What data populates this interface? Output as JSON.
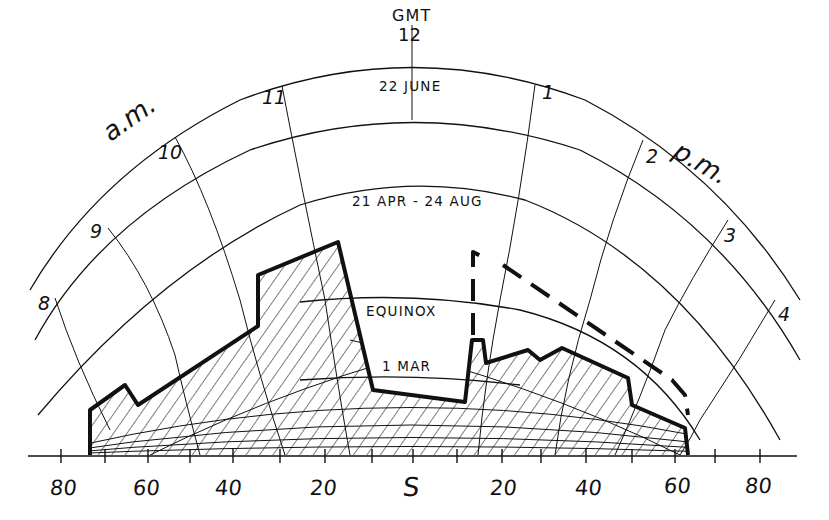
{
  "diagram": {
    "time_reference": {
      "label": "GMT",
      "value": "12"
    },
    "date_curves": [
      {
        "id": "summer-solstice",
        "label": "22 JUNE"
      },
      {
        "id": "apr-aug",
        "label": "21 APR - 24 AUG"
      },
      {
        "id": "equinox",
        "label": "EQUINOX"
      },
      {
        "id": "mar",
        "label": "1 MAR"
      }
    ],
    "hour_lines": {
      "am_label": "a.m.",
      "pm_label": "p.m.",
      "am": [
        "8",
        "9",
        "10",
        "11"
      ],
      "pm": [
        "1",
        "2",
        "3",
        "4"
      ]
    },
    "azimuth_axis": {
      "labels": [
        "80",
        "60",
        "40",
        "20",
        "S",
        "20",
        "40",
        "60",
        "80"
      ],
      "center_label": "S"
    },
    "legend": {
      "solid_outline": "existing obstruction (hatched)",
      "dashed_outline": "proposed obstruction"
    },
    "colors": {
      "ink": "#111111",
      "paper": "#ffffff"
    }
  }
}
